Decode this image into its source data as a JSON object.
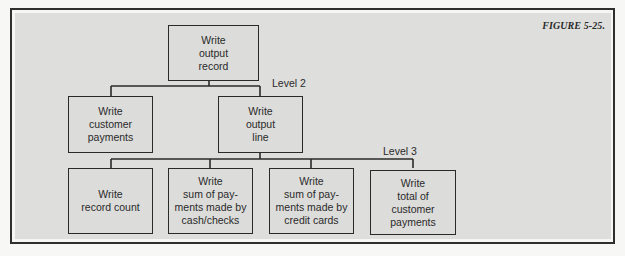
{
  "figure": {
    "caption": "FIGURE 5-25."
  },
  "levels": {
    "level2": "Level 2",
    "level3": "Level 3"
  },
  "nodes": {
    "root": {
      "label": "Write\noutput\nrecord"
    },
    "level2": [
      {
        "label": "Write\ncustomer\npayments"
      },
      {
        "label": "Write\noutput\nline"
      }
    ],
    "level3": [
      {
        "label": "Write\nrecord count"
      },
      {
        "label": "Write\nsum of pay-\nments made by\ncash/checks"
      },
      {
        "label": "Write\nsum of pay-\nments made by\ncredit cards"
      },
      {
        "label": "Write\ntotal of\ncustomer\npayments"
      }
    ]
  },
  "colors": {
    "panel": "#dededc",
    "line": "#2a2a2a",
    "page": "#f7f7f5"
  }
}
